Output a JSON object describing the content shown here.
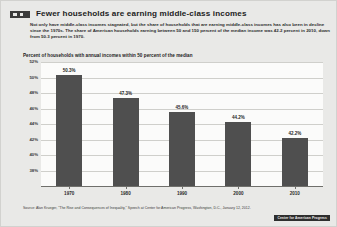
{
  "figure": {
    "badge_icon": "figure-number-badge",
    "title": "Fewer households are earning middle-class incomes",
    "deck": "Not only have middle-class incomes stagnated, but the share of households that are earning middle-class incomes has also been in decline since the 1970s. The share of American households earning between 50 and 150 percent of the median income was 42.2 percent in 2010, down from 50.3 percent in 1970.",
    "source": "Source: Alan Krueger, \"The Rise and Consequences of Inequality,\" Speech at Center for American Progress, Washington, D.C., January 12, 2012.",
    "credit_badge": "Center for American Progress"
  },
  "colors": {
    "bar": "#4f4f4f",
    "panel_background": "#e9e9e7",
    "plot_background": "#fbfbfa",
    "gridline": "#cfcfcb",
    "text": "#1c1c1c"
  },
  "chart_data": {
    "type": "bar",
    "title": "Percent of households with annual incomes within 50 percent of the median",
    "xlabel": "",
    "ylabel": "",
    "categories": [
      "1970",
      "1980",
      "1990",
      "2000",
      "2010"
    ],
    "values": [
      50.3,
      47.3,
      45.6,
      44.2,
      42.2
    ],
    "data_labels": [
      "50.3%",
      "47.3%",
      "45.6%",
      "44.2%",
      "42.2%"
    ],
    "ylim": [
      36,
      52
    ],
    "yticks": [
      52,
      50,
      48,
      46,
      44,
      42,
      40,
      38
    ],
    "ytick_labels": [
      "52%",
      "50%",
      "48%",
      "46%",
      "44%",
      "42%",
      "40%",
      "38%"
    ],
    "grid": true,
    "legend": "none"
  }
}
